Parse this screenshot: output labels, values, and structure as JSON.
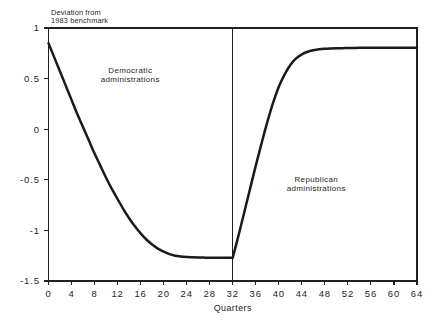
{
  "chart_data": {
    "type": "line",
    "title": "",
    "subtitle": "",
    "xlabel": "Quarters",
    "ylabel_lines": [
      "Deviation from",
      "1983 benchmark"
    ],
    "xlim": [
      0,
      64
    ],
    "ylim": [
      -1.5,
      1
    ],
    "grid": false,
    "legend": "none",
    "xticks": [
      0,
      4,
      8,
      12,
      16,
      20,
      24,
      28,
      32,
      36,
      40,
      44,
      48,
      52,
      56,
      60,
      64
    ],
    "xtick_labels": [
      "0",
      "4",
      "8",
      "12",
      "16",
      "20",
      "24",
      "28",
      "32",
      "36",
      "40",
      "44",
      "48",
      "52",
      "56",
      "60",
      "64"
    ],
    "yticks": [
      1,
      0.5,
      0,
      -0.5,
      -1,
      -1.5
    ],
    "ytick_labels": [
      "1",
      "0.5",
      "0",
      "-0.5",
      "-1",
      "-1.5"
    ],
    "series": [
      {
        "name": "Deviation from 1983 benchmark",
        "color": "#1a1a1a",
        "x": [
          0,
          1,
          2,
          3,
          4,
          5,
          6,
          7,
          8,
          9,
          10,
          11,
          12,
          13,
          14,
          15,
          16,
          17,
          18,
          19,
          20,
          21,
          22,
          23,
          24,
          25,
          26,
          27,
          28,
          29,
          30,
          31,
          32,
          33,
          34,
          35,
          36,
          37,
          38,
          39,
          40,
          41,
          42,
          43,
          44,
          45,
          46,
          47,
          48,
          49,
          50,
          51,
          52,
          53,
          54,
          55,
          56,
          57,
          58,
          59,
          60,
          61,
          62,
          63,
          64
        ],
        "y": [
          0.85,
          0.71,
          0.57,
          0.43,
          0.29,
          0.15,
          0.02,
          -0.11,
          -0.24,
          -0.36,
          -0.48,
          -0.59,
          -0.69,
          -0.79,
          -0.88,
          -0.96,
          -1.03,
          -1.09,
          -1.14,
          -1.18,
          -1.21,
          -1.235,
          -1.25,
          -1.258,
          -1.263,
          -1.266,
          -1.268,
          -1.269,
          -1.27,
          -1.27,
          -1.27,
          -1.27,
          -1.27,
          -1.05,
          -0.82,
          -0.59,
          -0.36,
          -0.14,
          0.07,
          0.26,
          0.42,
          0.54,
          0.635,
          0.7,
          0.74,
          0.765,
          0.78,
          0.79,
          0.795,
          0.798,
          0.8,
          0.801,
          0.802,
          0.803,
          0.804,
          0.804,
          0.805,
          0.805,
          0.805,
          0.805,
          0.805,
          0.805,
          0.805,
          0.805,
          0.805
        ]
      }
    ],
    "vertical_divider": {
      "x": 32,
      "color": "#231f20"
    },
    "annotations": [
      {
        "name": "democratic-administrations",
        "lines": [
          "Democratic",
          "administrations"
        ],
        "x": 14.2,
        "y": 0.56
      },
      {
        "name": "republican-administrations",
        "lines": [
          "Republican",
          "administrations"
        ],
        "x": 46.5,
        "y": -0.52
      }
    ]
  }
}
